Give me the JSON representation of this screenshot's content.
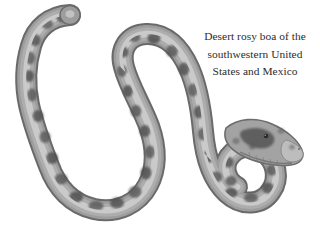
{
  "page": {
    "background_color": "#ffffff",
    "width": 320,
    "height": 243
  },
  "caption": {
    "lines": [
      "Desert rosy boa of the",
      "southwestern United",
      "States and Mexico"
    ],
    "text_color": "#2b2b2b",
    "alignment": "center"
  },
  "illustration": {
    "subject": "Desert rosy boa",
    "style": "grayscale halftone photograph cutout",
    "colors": {
      "body_outline": "#5d5d5d",
      "body_mid": "#9a9a9a",
      "body_highlight": "#cfcfcf",
      "blotch_dark": "#5a5a5a",
      "blotch_darkest": "#3f3f3f",
      "head_snout": "#b9b9b9",
      "eye": "#2a2a2a"
    },
    "parts": {
      "tail_tip_label": "tail-tip",
      "left_loop_label": "left-coil",
      "middle_loop_label": "middle-coil",
      "bottom_loop_label": "bottom-coil",
      "neck_label": "neck",
      "head_label": "head",
      "eye_label": "eye",
      "snout_label": "snout"
    }
  }
}
